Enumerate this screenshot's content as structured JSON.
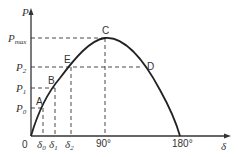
{
  "diagram": {
    "type": "power-angle curve",
    "y_axis_label": "P",
    "x_axis_label": "δ",
    "origin_label": "0",
    "y_ticks": [
      {
        "label": "P",
        "sub": "max",
        "y": 38
      },
      {
        "label": "P",
        "sub": "2",
        "y": 67
      },
      {
        "label": "P",
        "sub": "1",
        "y": 88
      },
      {
        "label": "P",
        "sub": "0",
        "y": 108
      }
    ],
    "x_ticks": [
      {
        "label": "δ",
        "sub": "0",
        "x": 43
      },
      {
        "label": "δ",
        "sub": "1",
        "x": 55
      },
      {
        "label": "δ",
        "sub": "2",
        "x": 71
      },
      {
        "label": "90°",
        "x": 105
      },
      {
        "label": "180°",
        "x": 180
      }
    ],
    "points": [
      {
        "name": "A",
        "x": 43,
        "y": 108
      },
      {
        "name": "B",
        "x": 55,
        "y": 88
      },
      {
        "name": "E",
        "x": 71,
        "y": 67
      },
      {
        "name": "C",
        "x": 105,
        "y": 38
      },
      {
        "name": "D",
        "x": 143,
        "y": 67
      }
    ],
    "colors": {
      "line": "#222222",
      "dash": "#333333",
      "text": "#333333"
    }
  }
}
